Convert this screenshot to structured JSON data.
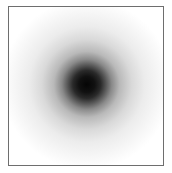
{
  "image": {
    "description": "Soft-edged dark circular blob (Gaussian-like spot) centered in a thin gray bordered square on white background",
    "colors": {
      "background": "#ffffff",
      "border": "#6e6e6e",
      "core": "#050505"
    }
  }
}
